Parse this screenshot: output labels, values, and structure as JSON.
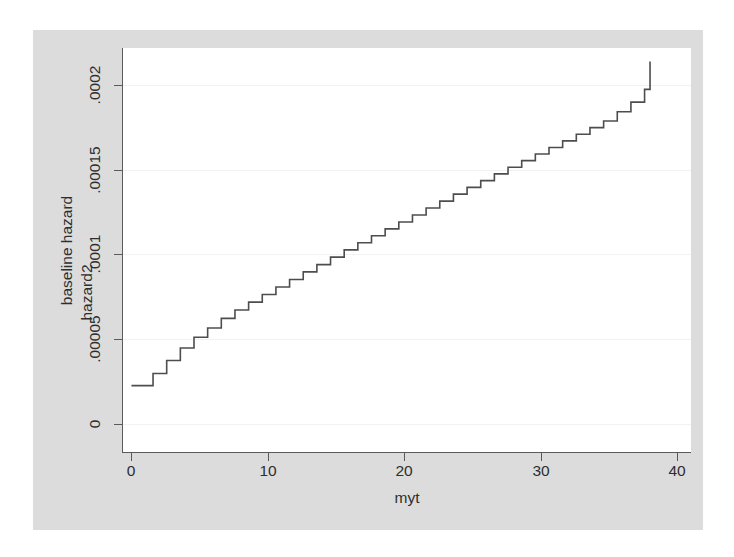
{
  "figure": {
    "background_color": "#dcdcdc",
    "plot_background_color": "#ffffff",
    "line_color": "#4d4d4d",
    "grid_color": "#f2f2f2",
    "axis_color": "#5a5a5a"
  },
  "chart_data": {
    "type": "line",
    "subtype": "step",
    "title": "",
    "xlabel": "myt",
    "ylabel_outer": "baseline hazard",
    "ylabel_inner": "hazard2",
    "xlim": [
      -0.6,
      41.0
    ],
    "ylim": [
      -1.73e-05,
      0.00022195
    ],
    "xticks": [
      0,
      10,
      20,
      30,
      40
    ],
    "xticklabels": [
      "0",
      "10",
      "20",
      "30",
      "40"
    ],
    "yticks": [
      0,
      5e-05,
      0.0001,
      0.00015,
      0.0002
    ],
    "yticklabels": [
      "0",
      ".00005",
      ".0001",
      ".00015",
      ".0002"
    ],
    "grid": "horizontal",
    "legend": "none",
    "series": [
      {
        "name": "hazard2",
        "step_mode": "post",
        "x": [
          0.6,
          1.6,
          2.6,
          3.6,
          4.6,
          5.6,
          6.6,
          7.6,
          8.6,
          9.6,
          10.6,
          11.6,
          12.6,
          13.6,
          14.6,
          15.6,
          16.6,
          17.6,
          18.6,
          19.6,
          20.6,
          21.6,
          22.6,
          23.6,
          24.6,
          25.6,
          26.6,
          27.6,
          28.6,
          29.6,
          30.6,
          31.6,
          32.6,
          33.6,
          34.6,
          35.6,
          36.6,
          37.6,
          38.0
        ],
        "y": [
          2.25e-05,
          2.97e-05,
          3.73e-05,
          4.47e-05,
          5.11e-05,
          5.65e-05,
          6.22e-05,
          6.72e-05,
          7.18e-05,
          7.63e-05,
          8.08e-05,
          8.52e-05,
          8.97e-05,
          9.4e-05,
          9.84e-05,
          0.0001027,
          0.0001069,
          0.000111,
          0.0001151,
          0.0001192,
          0.0001233,
          0.0001274,
          0.0001315,
          0.0001356,
          0.0001396,
          0.0001436,
          0.0001476,
          0.0001515,
          0.0001554,
          0.0001593,
          0.0001632,
          0.0001671,
          0.000171,
          0.0001749,
          0.0001788,
          0.0001843,
          0.00019,
          0.0001975,
          0.000214
        ]
      }
    ]
  }
}
